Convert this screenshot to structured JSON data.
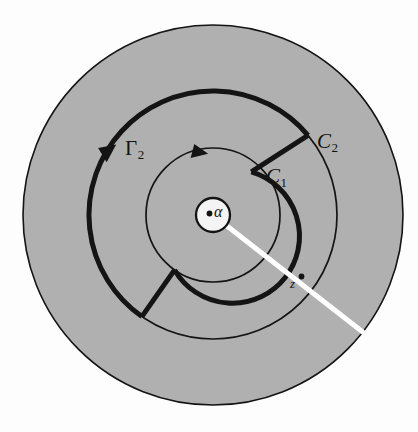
{
  "figure": {
    "type": "complex-analysis-annulus-contour-diagram",
    "background": "#ffffff",
    "shaded_region_color": "#b0b0b0",
    "stroke_color": "#141414",
    "cut_line_color": "#ffffff",
    "center": {
      "x": 213,
      "y": 215
    },
    "circles": [
      {
        "name": "outer-boundary",
        "radius": 190,
        "stroke_width": 1.6,
        "filled": true
      },
      {
        "name": "C2",
        "radius": 124,
        "stroke_width": 1.6,
        "filled": false
      },
      {
        "name": "C1",
        "radius": 67,
        "stroke_width": 1.6,
        "filled": false
      },
      {
        "name": "alpha-hole",
        "radius": 17,
        "stroke_width": 2.2,
        "filled": true,
        "fill": "#f2f2f2"
      }
    ],
    "contour": {
      "name": "Gamma-2",
      "stroke_width": 5,
      "outer_radius": 124,
      "inner_radius": 67,
      "gap_start_deg": -40,
      "gap_end_deg": 125,
      "arrow_positions_deg": [
        -150,
        -75
      ]
    },
    "cut_line": {
      "name": "branch-cut",
      "angle_deg": 38,
      "width": 5,
      "from_radius": 17,
      "to_radius": 190
    },
    "points": [
      {
        "name": "alpha-point",
        "label": "α",
        "radius": 0,
        "angle_deg": 0
      },
      {
        "name": "z-point",
        "label": "z",
        "radius": 95,
        "angle_deg": 38
      }
    ]
  },
  "labels": {
    "gamma2": {
      "base": "Γ",
      "sub": "2"
    },
    "c2": {
      "base": "C",
      "sub": "2"
    },
    "c1": {
      "base": "C",
      "sub": "1"
    },
    "alpha": "α",
    "z": "z"
  }
}
